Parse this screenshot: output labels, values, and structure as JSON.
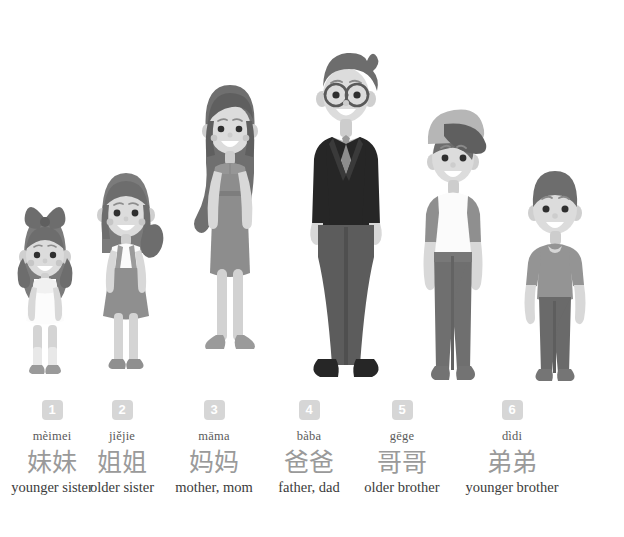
{
  "page": {
    "background_color": "#ffffff"
  },
  "palette": {
    "badge_bg": "#d6d6d6",
    "badge_text": "#ffffff",
    "hanzi_color": "#9a9a9a",
    "pinyin_color": "#5a5a5a",
    "meaning_color": "#3b3b3b",
    "skin": "#d8d8d8",
    "skin_shadow": "#c2c2c2",
    "hair_dark": "#6d6d6d",
    "hair_mid": "#8a8a8a",
    "suit_dark": "#262626",
    "cloth_mid": "#9b9b9b",
    "cloth_light": "#f2f2f2",
    "pants_dark": "#6f6f6f"
  },
  "people": [
    {
      "index": "1",
      "number": "1",
      "pinyin": "mèimei",
      "hanzi": "妹妹",
      "meaning": "younger sister",
      "figure_name": "younger-sister-figure",
      "outfit": "white dress, pigtails with bow"
    },
    {
      "index": "2",
      "number": "2",
      "pinyin": "jiějie",
      "hanzi": "姐姐",
      "meaning": "older sister",
      "figure_name": "older-sister-figure",
      "outfit": "white top with gray pinafore skirt, side ponytail"
    },
    {
      "index": "3",
      "number": "3",
      "pinyin": "māma",
      "hanzi": "妈妈",
      "meaning": "mother, mom",
      "figure_name": "mother-figure",
      "outfit": "gray sheath dress, long wavy hair, flats"
    },
    {
      "index": "4",
      "number": "4",
      "pinyin": "bàba",
      "hanzi": "爸爸",
      "meaning": "father, dad",
      "figure_name": "father-figure",
      "outfit": "dark suit, necktie, round glasses, quiff hair"
    },
    {
      "index": "5",
      "number": "5",
      "pinyin": "gēge",
      "hanzi": "哥哥",
      "meaning": "older brother",
      "figure_name": "older-brother-figure",
      "outfit": "baseball cap, white raglan tee, dark jeans"
    },
    {
      "index": "6",
      "number": "6",
      "pinyin": "dìdi",
      "hanzi": "弟弟",
      "meaning": "younger brother",
      "figure_name": "younger-brother-figure",
      "outfit": "gray t-shirt, dark trousers, short hair"
    }
  ]
}
